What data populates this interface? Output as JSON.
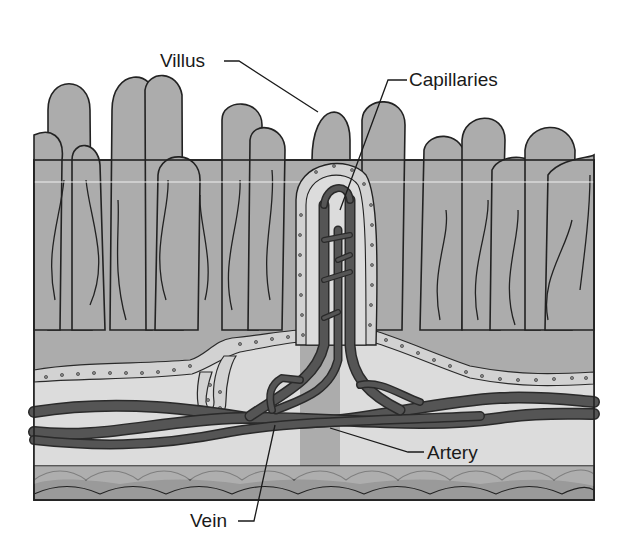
{
  "diagram": {
    "labels": {
      "villus": "Villus",
      "capillaries": "Capillaries",
      "artery": "Artery",
      "vein": "Vein"
    },
    "colors": {
      "villus_fill": "#acacac",
      "lamina_fill": "#dcdcdc",
      "vessel_fill": "#5a5a5a",
      "epithelium_fill": "#d2d2d2",
      "muscle_fill": "#9a9a9a",
      "outline": "#222222",
      "background": "#ffffff"
    }
  }
}
